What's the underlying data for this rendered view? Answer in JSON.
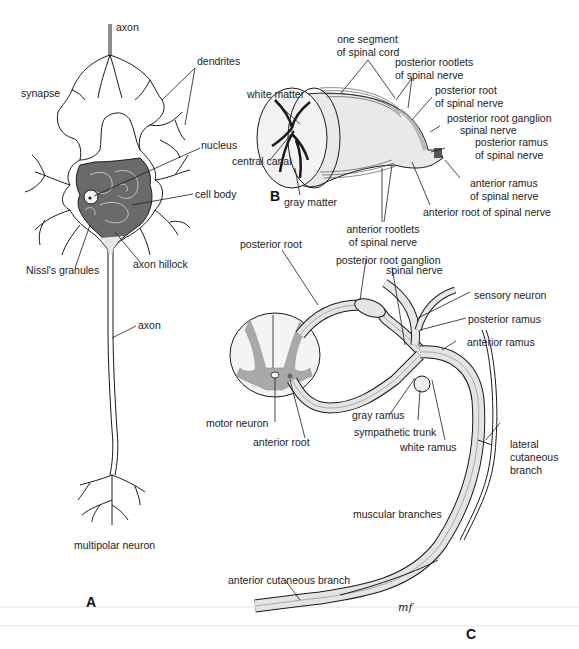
{
  "figure": {
    "panels": {
      "a": "A",
      "b": "B",
      "c": "C"
    },
    "signature": "MF"
  },
  "panel_a": {
    "title": "multipolar neuron",
    "labels": {
      "axon_top": "axon",
      "dendrites": "dendrites",
      "synapse": "synapse",
      "nucleus": "nucleus",
      "cell_body": "cell body",
      "nissl": "Nissl's granules",
      "axon_hillock": "axon hillock",
      "axon_mid": "axon",
      "caption": "multipolar neuron"
    }
  },
  "panel_b": {
    "labels": {
      "segment_1": "one segment",
      "segment_2": "of spinal cord",
      "post_rootlets_1": "posterior rootlets",
      "post_rootlets_2": "of spinal nerve",
      "white_matter": "white matter",
      "post_root_1": "posterior root",
      "post_root_2": "of spinal nerve",
      "post_ganglion": "posterior root ganglion",
      "spinal_nerve": "spinal nerve",
      "central_canal": "central canal",
      "post_ramus_1": "posterior ramus",
      "post_ramus_2": "of spinal nerve",
      "ant_ramus_1": "anterior ramus",
      "ant_ramus_2": "of spinal nerve",
      "gray_matter": "gray matter",
      "ant_root": "anterior root of spinal nerve",
      "ant_rootlets_1": "anterior rootlets",
      "ant_rootlets_2": "of spinal nerve"
    }
  },
  "panel_c": {
    "labels": {
      "post_root": "posterior root",
      "post_ganglion": "posterior root ganglion",
      "spinal_nerve": "spinal nerve",
      "sensory_neuron": "sensory neuron",
      "post_ramus": "posterior ramus",
      "ant_ramus": "anterior ramus",
      "motor_neuron": "motor neuron",
      "gray_ramus": "gray ramus",
      "sympathetic_trunk": "sympathetic trunk",
      "anterior_root": "anterior root",
      "white_ramus": "white ramus",
      "lateral_1": "lateral",
      "lateral_2": "cutaneous",
      "lateral_3": "branch",
      "muscular": "muscular branches",
      "ant_cutaneous": "anterior cutaneous branch"
    }
  },
  "colors": {
    "line": "#1a1a1a",
    "gray_matter": "#a9a9a9",
    "nerve_fill": "#e4e4e4",
    "white_matter": "#f2f2f2",
    "cell_body": "#5a5a5a"
  }
}
